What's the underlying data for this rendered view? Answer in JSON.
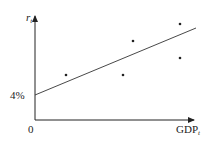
{
  "chart_data": {
    "type": "scatter",
    "title": "",
    "xlabel": "GDP",
    "xlabel_sub": "t",
    "ylabel": "r",
    "ylabel_sub": "t",
    "origin_label": "0",
    "y_intercept_label": "4%",
    "grid": false,
    "legend": "none",
    "points": [
      {
        "x": 0.19,
        "y": 0.27
      },
      {
        "x": 0.55,
        "y": 0.27
      },
      {
        "x": 0.61,
        "y": 0.59
      },
      {
        "x": 0.9,
        "y": 0.76
      },
      {
        "x": 0.9,
        "y": 0.44
      }
    ],
    "trend_line": {
      "x0": 0,
      "y0": 0.0,
      "x1": 1.0,
      "y1": 0.64,
      "intercept_label": "4%"
    },
    "pixel_points": [
      [
        66,
        75
      ],
      [
        123,
        75
      ],
      [
        133,
        41
      ],
      [
        180,
        24
      ],
      [
        180,
        58
      ]
    ],
    "pixel_line": [
      [
        35,
        95
      ],
      [
        196,
        28
      ]
    ]
  }
}
